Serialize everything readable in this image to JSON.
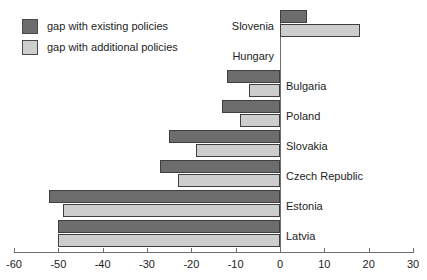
{
  "chart_data": {
    "type": "bar",
    "orientation": "horizontal",
    "title": "",
    "xlabel": "",
    "ylabel": "",
    "xlim": [
      -60,
      30
    ],
    "xticks": [
      -60,
      -50,
      -40,
      -30,
      -20,
      -10,
      0,
      10,
      20,
      30
    ],
    "xtick_labels": [
      "-60",
      "-50",
      "-40",
      "-30",
      "-20",
      "-10",
      "0",
      "10",
      "20",
      "30"
    ],
    "grid": false,
    "legend_position": "top-left",
    "categories": [
      "Slovenia",
      "Hungary",
      "Bulgaria",
      "Poland",
      "Slovakia",
      "Czech Republic",
      "Estonia",
      "Latvia"
    ],
    "series": [
      {
        "name": "gap with existing policies",
        "color": "#6d6d6d",
        "values": [
          6,
          0,
          -12,
          -13,
          -25,
          -27,
          -52,
          -50
        ]
      },
      {
        "name": "gap with additional policies",
        "color": "#cdcdcd",
        "values": [
          18,
          0,
          -7,
          -9,
          -19,
          -23,
          -49,
          -50
        ]
      }
    ]
  },
  "legend": {
    "items": [
      {
        "label": "gap with existing policies",
        "swatch": "#6d6d6d"
      },
      {
        "label": "gap with additional policies",
        "swatch": "#cdcdcd"
      }
    ]
  },
  "axis": {
    "zero_line_color": "#6e6e6e",
    "tick_color": "#6e6e6e"
  }
}
